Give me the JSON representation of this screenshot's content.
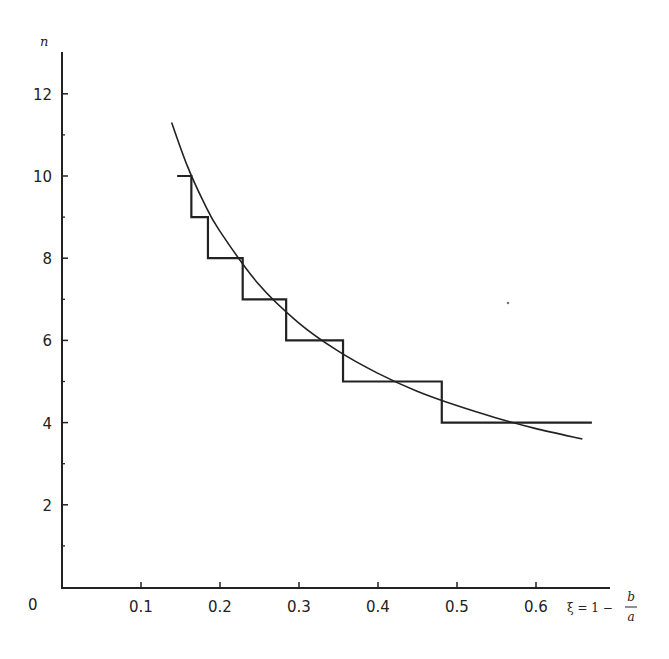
{
  "chart_data": {
    "type": "line",
    "title": "",
    "xlabel": "ξ = 1 − b/a",
    "xlabel_parts": {
      "lhs": "ξ = 1 −",
      "numerator": "b",
      "denominator": "a"
    },
    "ylabel": "n",
    "xlim": [
      0,
      0.7
    ],
    "ylim": [
      0,
      13
    ],
    "x_ticks": [
      0.1,
      0.2,
      0.3,
      0.4,
      0.5,
      0.6
    ],
    "x_tick_labels": [
      "0.1",
      "0.2",
      "0.3",
      "0.4",
      "0.5",
      "0.6"
    ],
    "y_ticks": [
      2,
      4,
      6,
      8,
      10,
      12
    ],
    "y_tick_labels": [
      "2",
      "4",
      "6",
      "8",
      "10",
      "12"
    ],
    "y_minor_ticks": [
      1,
      3,
      5,
      7,
      9,
      11
    ],
    "origin_label": "0",
    "grid": false,
    "legend": null,
    "series": [
      {
        "name": "continuous curve",
        "style": "smooth line",
        "x": [
          0.14,
          0.16,
          0.18,
          0.2,
          0.25,
          0.3,
          0.35,
          0.4,
          0.45,
          0.5,
          0.55,
          0.6,
          0.66
        ],
        "y": [
          11.3,
          10.24,
          9.39,
          8.69,
          7.37,
          6.44,
          5.75,
          5.21,
          4.77,
          4.42,
          4.12,
          3.86,
          3.6
        ]
      },
      {
        "name": "integer steps",
        "style": "staircase",
        "steps": [
          {
            "n": 10,
            "x_start": 0.147,
            "x_end": 0.165
          },
          {
            "n": 9,
            "x_start": 0.165,
            "x_end": 0.186
          },
          {
            "n": 8,
            "x_start": 0.186,
            "x_end": 0.23
          },
          {
            "n": 7,
            "x_start": 0.23,
            "x_end": 0.285
          },
          {
            "n": 6,
            "x_start": 0.285,
            "x_end": 0.357
          },
          {
            "n": 5,
            "x_start": 0.357,
            "x_end": 0.482
          },
          {
            "n": 4,
            "x_start": 0.482,
            "x_end": 0.672
          }
        ]
      }
    ]
  },
  "colors": {
    "ink": "#222222",
    "background": "#ffffff"
  }
}
